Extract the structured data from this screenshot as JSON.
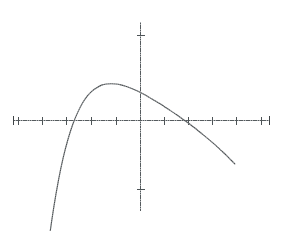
{
  "figure": {
    "background_color": "#ffffff",
    "line_color": "#4a4f52",
    "axis_color": "#555b5e",
    "width": 283,
    "height": 231
  },
  "chart_data": {
    "type": "line",
    "title": "",
    "subtitle": "",
    "xlabel": "",
    "ylabel": "",
    "description": "A cubic curve y = -k(x+3)x(x-3) rising from lower left, crossing the x-axis at x = -3, 0 and 3, with a local maximum between x = -3 and 0 and a local minimum between 0 and 3, then rising steeply to the upper right.",
    "grid": false,
    "legend": null,
    "legend_position": "none",
    "xlim": [
      -5.5,
      5.5
    ],
    "ylim": [
      -4.2,
      4.2
    ],
    "x_ticks": [
      -5,
      -4,
      -3,
      -2,
      -1,
      0,
      1,
      2,
      3,
      4,
      5
    ],
    "y_ticks": [
      -3,
      3
    ],
    "x_tick_labels": [
      "",
      "",
      "",
      "",
      "",
      "",
      "",
      "",
      "",
      "",
      ""
    ],
    "y_tick_labels": [
      "",
      ""
    ],
    "axis_arrows": "both-ends-x",
    "roots": [
      -3,
      0,
      3
    ],
    "local_maximum": {
      "x": -1.73,
      "y": 2.6
    },
    "local_minimum": {
      "x": 1.73,
      "y": -2.6
    },
    "series": [
      {
        "name": "y = -0.29 x (x^2 - 9)",
        "style": "dotted",
        "color": "#4a4f52",
        "x": [
          -3.95,
          -3.8,
          -3.6,
          -3.4,
          -3.2,
          -3.0,
          -2.8,
          -2.6,
          -2.4,
          -2.2,
          -2.0,
          -1.8,
          -1.6,
          -1.4,
          -1.2,
          -1.0,
          -0.8,
          -0.6,
          -0.4,
          -0.2,
          0.0,
          0.2,
          0.4,
          0.6,
          0.8,
          1.0,
          1.2,
          1.4,
          1.6,
          1.8,
          2.0,
          2.2,
          2.4,
          2.6,
          2.8,
          3.0,
          3.2,
          3.4,
          3.6,
          3.8,
          3.95
        ],
        "y": [
          -5.4,
          -4.3,
          -3.12,
          -2.14,
          -1.33,
          -0.68,
          -0.15,
          0.26,
          0.59,
          0.84,
          1.02,
          1.14,
          1.23,
          1.27,
          1.28,
          1.27,
          1.24,
          1.19,
          1.13,
          1.06,
          0.98,
          0.89,
          0.79,
          0.69,
          0.59,
          0.48,
          0.37,
          0.26,
          0.14,
          0.02,
          -0.1,
          -0.23,
          -0.36,
          -0.5,
          -0.64,
          -0.78,
          -0.93,
          -1.09,
          -1.25,
          -1.42,
          -1.55
        ]
      }
    ]
  },
  "geometry": {
    "origin_px": {
      "x": 140,
      "y": 120
    },
    "x_axis": {
      "start_px": 13,
      "end_px": 270,
      "y_px": 120
    },
    "y_axis": {
      "x_px": 140,
      "top_px": 22,
      "bottom_px": 211
    },
    "x_tick_positions_px": [
      18,
      42,
      66,
      91,
      116,
      164,
      188,
      212,
      236,
      261
    ],
    "y_tick_positions_px": [
      35,
      190
    ],
    "tick_half_length_px": 4,
    "curve_peak_px": {
      "x": 98,
      "y": 39
    },
    "curve_trough_px": {
      "x": 182,
      "y": 180
    },
    "curve_start_px": {
      "x": 51,
      "y": 213
    },
    "curve_end_px": {
      "x": 229,
      "y": 22
    }
  }
}
